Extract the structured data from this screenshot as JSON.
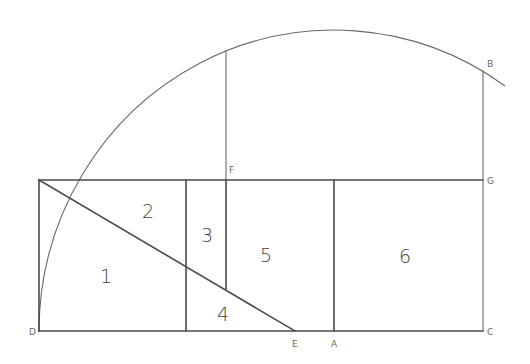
{
  "diagram": {
    "type": "golden-rectangle-construction",
    "colors": {
      "line": "#4a4a4a",
      "arc": "#6a6a6a",
      "text": "#444444",
      "background": "#ffffff"
    },
    "points": {
      "D": "D",
      "E": "E",
      "A": "A",
      "C": "C",
      "G": "G",
      "F": "F",
      "B": "B"
    },
    "regions": {
      "r1": "1",
      "r2": "2",
      "r3": "3",
      "r4": "4",
      "r5": "5",
      "r6": "6"
    }
  }
}
